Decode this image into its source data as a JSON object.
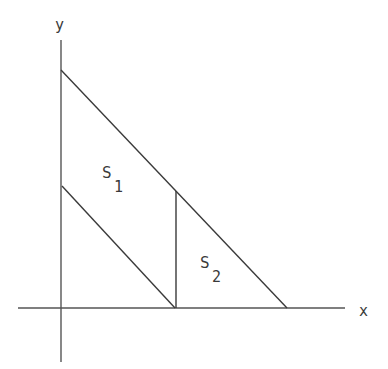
{
  "diagram": {
    "axes": {
      "x_label": "x",
      "y_label": "y"
    },
    "regions": [
      {
        "name": "S",
        "subscript": "1"
      },
      {
        "name": "S",
        "subscript": "2"
      }
    ],
    "colors": {
      "line": "#3a3a3a",
      "axis": "#555555",
      "background": "#ffffff"
    },
    "geometry": {
      "origin": [
        61,
        308
      ],
      "y_axis": {
        "x": 61,
        "top": 40,
        "bottom": 362
      },
      "x_axis": {
        "y": 308,
        "left": 18,
        "right": 345
      },
      "upper_line": {
        "from": [
          61,
          70
        ],
        "to": [
          287,
          308
        ]
      },
      "lower_line": {
        "from": [
          62,
          186
        ],
        "to": [
          175,
          308
        ]
      },
      "vertical_segment": {
        "x": 176,
        "top": 191,
        "bottom": 308
      }
    }
  }
}
